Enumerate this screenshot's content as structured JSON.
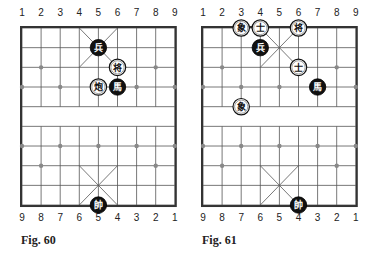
{
  "figures": [
    {
      "id": "left",
      "caption": "Fig. 60",
      "top_numbers": [
        "1",
        "2",
        "3",
        "4",
        "5",
        "6",
        "7",
        "8",
        "9"
      ],
      "bottom_numbers": [
        "9",
        "8",
        "7",
        "6",
        "5",
        "4",
        "3",
        "2",
        "1"
      ],
      "pieces": [
        {
          "char": "兵",
          "side": "black",
          "col": 5,
          "row": 1,
          "name": "soldier"
        },
        {
          "char": "将",
          "side": "white",
          "col": 6,
          "row": 2,
          "name": "general"
        },
        {
          "char": "炮",
          "side": "white",
          "col": 5,
          "row": 3,
          "name": "cannon"
        },
        {
          "char": "馬",
          "side": "black",
          "col": 6,
          "row": 3,
          "name": "horse"
        },
        {
          "char": "帥",
          "side": "black",
          "col": 5,
          "row": 9,
          "name": "marshal"
        }
      ]
    },
    {
      "id": "right",
      "caption": "Fig. 61",
      "top_numbers": [
        "1",
        "2",
        "3",
        "4",
        "5",
        "6",
        "7",
        "8",
        "9"
      ],
      "bottom_numbers": [
        "9",
        "8",
        "7",
        "6",
        "5",
        "4",
        "3",
        "2",
        "1"
      ],
      "pieces": [
        {
          "char": "象",
          "side": "white",
          "col": 3,
          "row": 0,
          "name": "elephant"
        },
        {
          "char": "士",
          "side": "white",
          "col": 4,
          "row": 0,
          "name": "advisor"
        },
        {
          "char": "将",
          "side": "white",
          "col": 6,
          "row": 0,
          "name": "general"
        },
        {
          "char": "兵",
          "side": "black",
          "col": 4,
          "row": 1,
          "name": "soldier"
        },
        {
          "char": "士",
          "side": "white",
          "col": 6,
          "row": 2,
          "name": "advisor"
        },
        {
          "char": "馬",
          "side": "black",
          "col": 7,
          "row": 3,
          "name": "horse"
        },
        {
          "char": "象",
          "side": "white",
          "col": 3,
          "row": 4,
          "name": "elephant"
        },
        {
          "char": "帥",
          "side": "black",
          "col": 6,
          "row": 9,
          "name": "marshal"
        }
      ]
    }
  ],
  "colors": {
    "line": "#555555",
    "border": "#333333",
    "black_piece": "#111111",
    "white_piece": "#ffffff"
  }
}
